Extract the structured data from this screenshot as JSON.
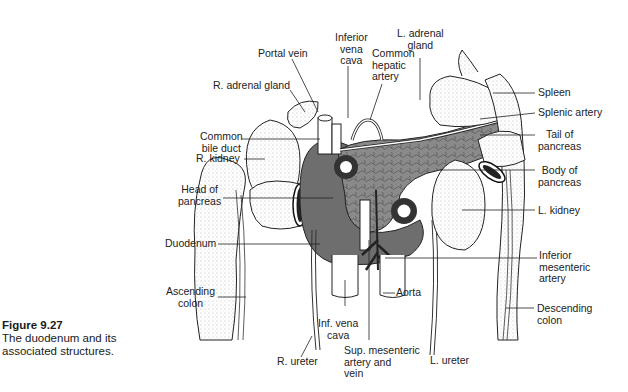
{
  "caption": {
    "number": "Figure 9.27",
    "text": "The duodenum and its associated structures."
  },
  "labels": {
    "portal_vein": "Portal vein",
    "inferior_vena_cava": "Inferior\nvena\ncava",
    "common_hepatic_artery": "Common\nhepatic\nartery",
    "l_adrenal_gland": "L. adrenal\ngland",
    "r_adrenal_gland": "R. adrenal gland",
    "common_bile_duct": "Common\nbile duct",
    "r_kidney": "R. kidney",
    "head_of_pancreas": "Head of\npancreas",
    "duodenum": "Duodenum",
    "ascending_colon": "Ascending\ncolon",
    "inf_vena_cava": "Inf. vena\ncava",
    "r_ureter": "R. ureter",
    "sup_mesenteric": "Sup. mesenteric\nartery and\nvein",
    "aorta": "Aorta",
    "l_ureter": "L. ureter",
    "spleen": "Spleen",
    "splenic_artery": "Splenic artery",
    "tail_of_pancreas": "Tail of\npancreas",
    "body_of_pancreas": "Body of\npancreas",
    "l_kidney": "L. kidney",
    "inferior_mesenteric_artery": "Inferior\nmesenteric\nartery",
    "descending_colon": "Descending\ncolon"
  }
}
